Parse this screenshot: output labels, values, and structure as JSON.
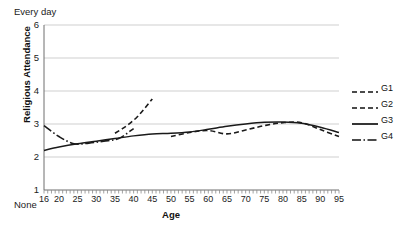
{
  "chart_data": {
    "type": "line",
    "title": "",
    "xlabel": "Age",
    "ylabel": "Religious Attendance",
    "xlim": [
      16,
      95
    ],
    "ylim": [
      1,
      6
    ],
    "grid": true,
    "legend_position": "right",
    "y_top_annotation": "Every day",
    "y_bottom_annotation": "None",
    "yticks": [
      1,
      2,
      3,
      4,
      5,
      6
    ],
    "ytick_labels": [
      "1",
      "2",
      "3",
      "4",
      "5",
      "6"
    ],
    "xticks": [
      16,
      20,
      25,
      30,
      35,
      40,
      45,
      50,
      55,
      60,
      65,
      70,
      75,
      80,
      85,
      90,
      95
    ],
    "xtick_labels": [
      "16",
      "20",
      "25",
      "30",
      "35",
      "40",
      "45",
      "50",
      "55",
      "60",
      "65",
      "70",
      "75",
      "80",
      "85",
      "90",
      "95"
    ],
    "series": [
      {
        "name": "G1",
        "style": "dashed",
        "color": "#1a1a1a",
        "x": [
          35,
          37,
          39,
          41,
          43,
          45
        ],
        "values": [
          2.72,
          2.86,
          3.02,
          3.22,
          3.48,
          3.76
        ]
      },
      {
        "name": "G2",
        "style": "dashed",
        "color": "#1a1a1a",
        "x": [
          50,
          55,
          60,
          65,
          70,
          75,
          80,
          85,
          90,
          95
        ],
        "values": [
          2.62,
          2.74,
          2.8,
          2.7,
          2.82,
          2.95,
          3.04,
          3.04,
          2.83,
          2.62
        ]
      },
      {
        "name": "G3",
        "style": "solid",
        "color": "#1a1a1a",
        "x": [
          16,
          20,
          25,
          30,
          35,
          40,
          45,
          50,
          55,
          60,
          65,
          70,
          75,
          80,
          85,
          90,
          95
        ],
        "values": [
          2.2,
          2.3,
          2.4,
          2.48,
          2.56,
          2.64,
          2.7,
          2.72,
          2.76,
          2.84,
          2.93,
          3.0,
          3.05,
          3.06,
          3.02,
          2.9,
          2.74
        ]
      },
      {
        "name": "G4",
        "style": "dash-dot",
        "color": "#1a1a1a",
        "x": [
          16,
          20,
          24,
          28,
          32,
          36,
          40
        ],
        "values": [
          2.95,
          2.62,
          2.4,
          2.42,
          2.48,
          2.56,
          2.86
        ]
      }
    ],
    "legend": [
      {
        "name": "G1",
        "style": "dashed"
      },
      {
        "name": "G2",
        "style": "dashed"
      },
      {
        "name": "G3",
        "style": "solid"
      },
      {
        "name": "G4",
        "style": "dash-dot"
      }
    ]
  }
}
